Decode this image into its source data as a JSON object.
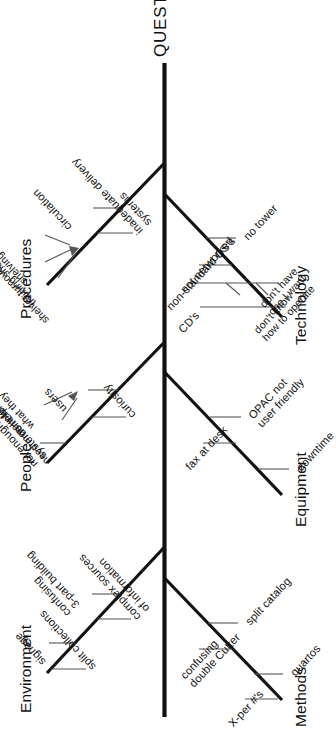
{
  "diagram": {
    "type": "fishbone-ishikawa",
    "orientation": "rotated-90-ccw",
    "effect": "QUESTIONS",
    "categories": [
      {
        "id": "environment",
        "label": "Environment",
        "side": "top",
        "causes": [
          "confusing\n3-part building",
          "complex sources\nof information",
          "signage",
          "split collections"
        ]
      },
      {
        "id": "people",
        "label": "People",
        "side": "top",
        "causes": [
          "users",
          "curiosity",
          "not enough\nsystems help"
        ],
        "subcauses": [
          "need more info",
          "don't know\nwhat they want"
        ]
      },
      {
        "id": "procedures",
        "label": "Procedures",
        "side": "top",
        "causes": [
          "circulation",
          "inadequate delivery\nsystems"
        ],
        "subcauses": [
          "shelver turnover",
          "training shelvers",
          "shelving mistakes"
        ]
      },
      {
        "id": "methods",
        "label": "Methods",
        "side": "bottom",
        "causes": [
          "split catalog",
          "confusing\ndouble Cutter",
          "quartos",
          "X-per #'s"
        ]
      },
      {
        "id": "equipment",
        "label": "Equipment",
        "side": "bottom",
        "causes": [
          "OPAC not\nuser friendly",
          "fax at desk",
          "downtime"
        ]
      },
      {
        "id": "technology",
        "label": "Technology",
        "side": "bottom",
        "causes": [
          "no tower",
          "not networked",
          "non-standard OS's",
          "CD's"
        ],
        "subcauses": [
          "don't know\nhow to operate",
          "don't have\none I want"
        ]
      }
    ],
    "colors": {
      "ink": "#111111",
      "background": "#ffffff",
      "hairline": "#555555"
    }
  },
  "labels": {
    "head": "QUESTIONS",
    "environment": "Environment",
    "people": "People",
    "procedures": "Procedures",
    "methods": "Methods",
    "equipment": "Equipment",
    "technology": "Technology",
    "env_c1": "confusing\n3-part building",
    "env_c2": "complex sources\nof information",
    "env_c3": "signage",
    "env_c4": "split collections",
    "peo_c1": "users",
    "peo_c2": "curiosity",
    "peo_c3": "not enough\nsystems help",
    "peo_s1": "need more info",
    "peo_s2": "don't know\nwhat they want",
    "pro_c1": "circulation",
    "pro_c2": "inadequate delivery\nsystems",
    "pro_s1": "shelver turnover",
    "pro_s2": "training shelvers",
    "pro_s3": "shelving mistakes",
    "met_c1": "split catalog",
    "met_c2": "confusing\ndouble Cutter",
    "met_c3": "quartos",
    "met_c4": "X-per #'s",
    "equ_c1": "OPAC not\nuser friendly",
    "equ_c2": "fax at desk",
    "equ_c3": "downtime",
    "tec_c1": "no tower",
    "tec_c2": "not networked",
    "tec_c3": "non-standard OS's",
    "tec_c4": "CD's",
    "tec_s1": "don't know\nhow to operate",
    "tec_s2": "don't have\none I want"
  }
}
